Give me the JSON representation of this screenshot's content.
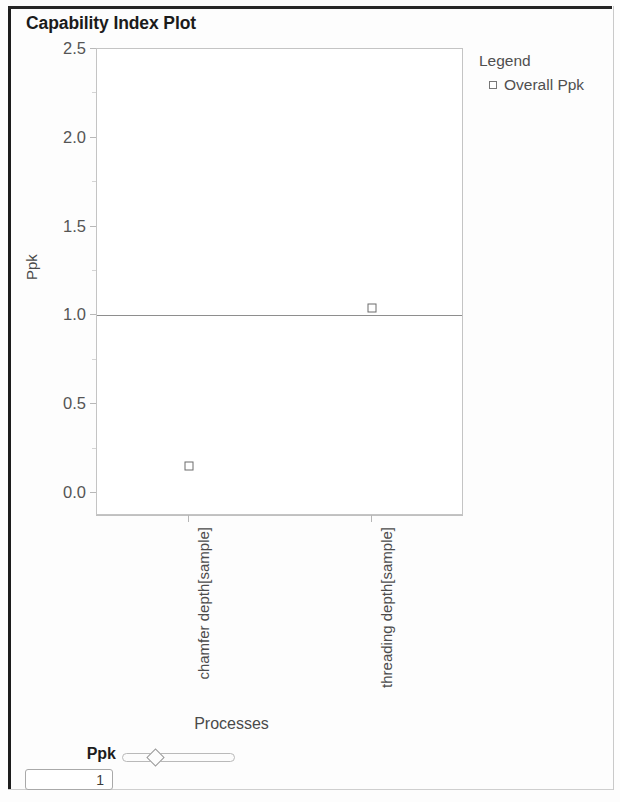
{
  "panel": {
    "title": "Capability Index Plot"
  },
  "legend": {
    "title": "Legend",
    "entries": [
      {
        "label": "Overall Ppk",
        "marker": "open-square-marker"
      }
    ]
  },
  "controls": {
    "ppk_label": "Ppk",
    "ppk_value": "1",
    "slider_name": "ppk-threshold-slider",
    "slider_fraction": 0.27
  },
  "chart_data": {
    "type": "scatter",
    "title": "Capability Index Plot",
    "xlabel": "Processes",
    "ylabel": "Ppk",
    "categories": [
      "chamfer depth[sample]",
      "threading depth[sample]"
    ],
    "series": [
      {
        "name": "Overall Ppk",
        "values": [
          0.15,
          1.04
        ]
      }
    ],
    "ylim": [
      -0.13,
      2.5
    ],
    "yticks": [
      0.0,
      0.5,
      1.0,
      1.5,
      2.0,
      2.5
    ],
    "ytick_labels": [
      "0.0",
      "0.5",
      "1.0",
      "1.5",
      "2.0",
      "2.5"
    ],
    "minor_yticks": [
      0.25,
      0.75,
      1.25,
      1.75,
      2.25
    ],
    "reference_lines": [
      {
        "name": "ppk-threshold-line",
        "y": 1.0,
        "color": "#8e8e8e"
      }
    ],
    "grid": false,
    "legend_position": "right",
    "marker_style": "open-square",
    "marker_color": "#6c6c6c"
  }
}
